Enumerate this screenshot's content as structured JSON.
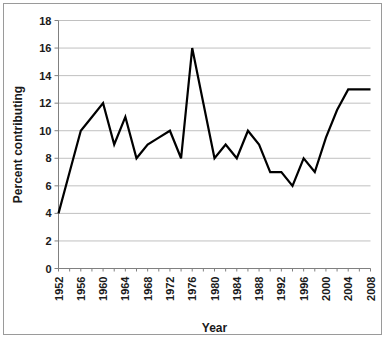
{
  "chart_data": {
    "type": "line",
    "title": "",
    "xlabel": "Year",
    "ylabel": "Percent contributing",
    "xlim": [
      1952,
      2008
    ],
    "ylim": [
      0,
      18
    ],
    "ytick_step": 2,
    "xtick_label_step": 4,
    "xtick_minor_step": 2,
    "grid": "horizontal",
    "legend": "none",
    "line_color": "#000000",
    "grid_color": "#c0c0c0",
    "axis_color": "#808080",
    "background_color": "#ffffff",
    "yticks": [
      0,
      2,
      4,
      6,
      8,
      10,
      12,
      14,
      16,
      18
    ],
    "ytick_labels": [
      "0",
      "2",
      "4",
      "6",
      "8",
      "10",
      "12",
      "14",
      "16",
      "18"
    ],
    "xticks": [
      1952,
      1956,
      1960,
      1964,
      1968,
      1972,
      1976,
      1980,
      1984,
      1988,
      1992,
      1996,
      2000,
      2004,
      2008
    ],
    "xtick_labels": [
      "1952",
      "1956",
      "1960",
      "1964",
      "1968",
      "1972",
      "1976",
      "1980",
      "1984",
      "1988",
      "1992",
      "1996",
      "2000",
      "2004",
      "2008"
    ],
    "x": [
      1952,
      1954,
      1956,
      1958,
      1960,
      1962,
      1964,
      1966,
      1968,
      1970,
      1972,
      1974,
      1976,
      1978,
      1980,
      1982,
      1984,
      1986,
      1988,
      1990,
      1992,
      1994,
      1996,
      1998,
      2000,
      2002,
      2004,
      2006,
      2008
    ],
    "values": [
      4,
      7,
      10,
      11,
      12,
      9,
      11,
      8,
      9,
      9.5,
      10,
      8,
      16,
      12,
      8,
      9,
      8,
      10,
      9,
      7,
      7,
      6,
      8,
      7,
      9.5,
      11.5,
      13,
      13,
      13
    ],
    "series": [
      {
        "name": "Percent contributing",
        "values": [
          4,
          7,
          10,
          11,
          12,
          9,
          11,
          8,
          9,
          9.5,
          10,
          8,
          16,
          12,
          8,
          9,
          8,
          10,
          9,
          7,
          7,
          6,
          8,
          7,
          9.5,
          11.5,
          13,
          13,
          13
        ]
      }
    ]
  }
}
